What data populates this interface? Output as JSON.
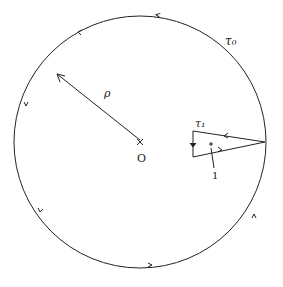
{
  "diagram": {
    "labels": {
      "outer_contour": "τ₀",
      "inner_contour": "τ₁",
      "radius": "ρ",
      "origin": "O",
      "point": "1"
    },
    "colors": {
      "stroke": "#222222",
      "background": "#ffffff"
    }
  }
}
